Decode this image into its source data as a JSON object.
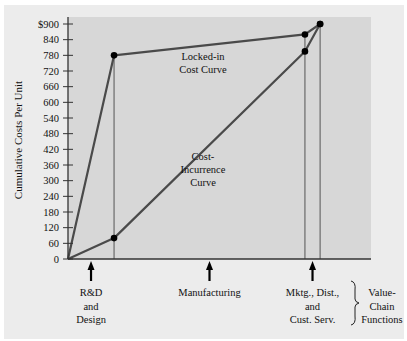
{
  "chart_data": {
    "type": "line",
    "title": "",
    "xlabel": "",
    "ylabel": "Cumulative Costs Per Unit",
    "ylim": [
      0,
      900
    ],
    "y_ticks": [
      "0",
      "60",
      "120",
      "180",
      "240",
      "300",
      "360",
      "420",
      "480",
      "540",
      "600",
      "660",
      "720",
      "780",
      "840",
      "$900"
    ],
    "y_tick_values": [
      0,
      60,
      120,
      180,
      240,
      300,
      360,
      420,
      480,
      540,
      600,
      660,
      720,
      780,
      840,
      900
    ],
    "x_stage_boundaries": [
      0,
      0.152,
      0.782,
      0.832
    ],
    "series": [
      {
        "name": "Locked-in Cost Curve",
        "label_lines": [
          "Locked-in",
          "Cost Curve"
        ],
        "x": [
          0,
          0.152,
          0.782,
          0.832
        ],
        "values": [
          0,
          780,
          860,
          900
        ]
      },
      {
        "name": "Cost-Incurrence Curve",
        "label_lines": [
          "Cost-",
          "Incurrence",
          "Curve"
        ],
        "x": [
          0,
          0.152,
          0.782,
          0.832
        ],
        "values": [
          0,
          80,
          795,
          900
        ]
      }
    ],
    "stages": [
      {
        "name": "R&D and Design",
        "label_lines": [
          "R&D",
          "and",
          "Design"
        ],
        "x": 0.076
      },
      {
        "name": "Manufacturing",
        "label_lines": [
          "Manufacturing"
        ],
        "x": 0.467
      },
      {
        "name": "Mktg., Dist., and Cust. Serv.",
        "label_lines": [
          "Mktg., Dist.,",
          "and",
          "Cust. Serv."
        ],
        "x": 0.807
      }
    ],
    "brace_label_lines": [
      "Value-",
      "Chain",
      "Functions"
    ],
    "grid": false,
    "legend": "none"
  },
  "colors": {
    "outer_panel": "#ececec",
    "plot_area": "#d7d7d7",
    "curve": "#4a4a4a",
    "axis": "#333333",
    "guide": "#555555",
    "point": "#000000"
  }
}
